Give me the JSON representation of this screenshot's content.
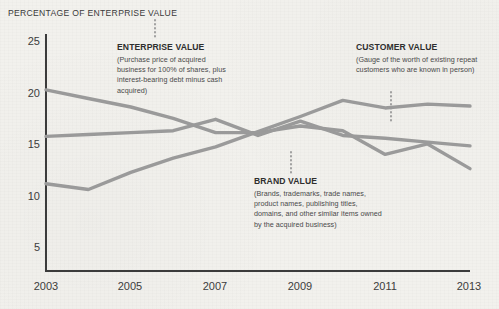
{
  "chart_title": "PERCENTAGE OF ENTERPRISE VALUE",
  "colors": {
    "background": "#f2f1ed",
    "line": "#9a9a9a",
    "axis": "#3b3b3b",
    "text": "#3b3b3b",
    "leader": "#9a9a9a"
  },
  "axes": {
    "y_ticks": [
      "25",
      "20",
      "15",
      "10",
      "5"
    ],
    "x_ticks": [
      "2003",
      "2005",
      "2007",
      "2009",
      "2011",
      "2013"
    ]
  },
  "annotations": {
    "enterprise": {
      "title": "ENTERPRISE VALUE",
      "body": "(Purchase price of acquired business for 100% of shares, plus interest-bearing debt minus cash acquired)"
    },
    "brand": {
      "title": "BRAND VALUE",
      "body": "(Brands, trademarks, trade names, product names, publishing titles, domains, and other similar items owned by the acquired business)"
    },
    "customer": {
      "title": "CUSTOMER VALUE",
      "body": "(Gauge of the worth of existing repeat customers who are known in person)"
    }
  },
  "chart_data": {
    "type": "line",
    "title": "PERCENTAGE OF ENTERPRISE VALUE",
    "xlabel": "",
    "ylabel": "Percentage of enterprise value",
    "xlim": [
      2003,
      2013
    ],
    "ylim": [
      0,
      25
    ],
    "yticks": [
      5,
      10,
      15,
      20,
      25
    ],
    "xticks": [
      2003,
      2005,
      2007,
      2009,
      2011,
      2013
    ],
    "grid": false,
    "legend": "annotations with dotted leader lines",
    "x": [
      2003,
      2004,
      2005,
      2006,
      2007,
      2008,
      2009,
      2010,
      2011,
      2012,
      2013
    ],
    "series": [
      {
        "name": "Enterprise Value",
        "values": [
          19.1,
          18.2,
          17.3,
          16.1,
          14.6,
          14.6,
          15.3,
          14.8,
          12.3,
          13.4,
          10.8
        ]
      },
      {
        "name": "Brand Value",
        "values": [
          14.2,
          14.4,
          14.6,
          14.8,
          16.0,
          14.3,
          15.8,
          14.3,
          14.0,
          13.6,
          13.2
        ]
      },
      {
        "name": "Customer Value",
        "values": [
          9.2,
          8.6,
          10.4,
          11.9,
          13.1,
          14.7,
          16.3,
          18.0,
          17.2,
          17.6,
          17.4
        ]
      }
    ]
  }
}
